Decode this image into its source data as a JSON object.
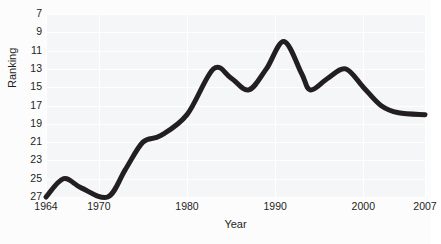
{
  "caption_fragment": "around 17th.",
  "chart_data": {
    "type": "line",
    "title": "",
    "xlabel": "Year",
    "ylabel": "Ranking",
    "grid": true,
    "legend": false,
    "y_inverted": true,
    "xlim": [
      1964,
      2007
    ],
    "ylim": [
      7,
      27
    ],
    "x_ticks": [
      1964,
      1970,
      1980,
      1990,
      2000,
      2007
    ],
    "x_tick_labels": [
      "1964",
      "1970",
      "1980",
      "1990",
      "2000",
      "2007"
    ],
    "y_ticks": [
      7,
      9,
      11,
      13,
      15,
      17,
      19,
      21,
      23,
      25,
      27
    ],
    "y_tick_labels": [
      "7",
      "9",
      "11",
      "13",
      "15",
      "17",
      "19",
      "21",
      "23",
      "25",
      "27"
    ],
    "series": [
      {
        "name": "Ranking",
        "color": "#231f20",
        "x": [
          1964,
          1966,
          1968,
          1971,
          1973,
          1975,
          1977,
          1980,
          1983,
          1985,
          1987,
          1989,
          1991,
          1993,
          1994,
          1996,
          1998,
          2000,
          2002,
          2004,
          2007
        ],
        "values": [
          27,
          25,
          26,
          27,
          24,
          21,
          20.3,
          18,
          13,
          14,
          15.3,
          13,
          10,
          13.5,
          15.3,
          14,
          13,
          15,
          17,
          17.8,
          18
        ]
      }
    ]
  },
  "colors": {
    "line": "#231f20",
    "plot_background": "#f5f6f7",
    "gridline": "#ffffff",
    "page_background": "#fcfcfd",
    "text": "#231f20"
  }
}
